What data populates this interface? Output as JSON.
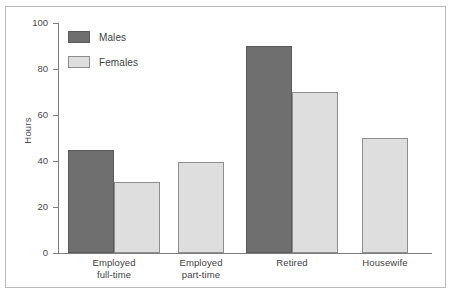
{
  "figure": {
    "caption_remnant": "",
    "border_color": "#b9b9b9"
  },
  "legend": {
    "position": "top-left-inside",
    "entries": [
      {
        "label": "Males",
        "color": "#6f6f6f"
      },
      {
        "label": "Females",
        "color": "#dedede"
      }
    ]
  },
  "axis": {
    "y_title": "Hours",
    "y_ticks": [
      "100",
      "80",
      "60",
      "40",
      "20",
      "0"
    ]
  },
  "chart_data": {
    "type": "bar",
    "title": "",
    "xlabel": "",
    "ylabel": "Hours",
    "ylim": [
      0,
      100
    ],
    "yticks": [
      0,
      20,
      40,
      60,
      80,
      100
    ],
    "grid": false,
    "legend_position": "upper left",
    "categories": [
      "Employed full-time",
      "Employed part-time",
      "Retired",
      "Housewife"
    ],
    "category_lines": [
      [
        "Employed",
        "full-time"
      ],
      [
        "Employed",
        "part-time"
      ],
      [
        "Retired"
      ],
      [
        "Housewife"
      ]
    ],
    "series": [
      {
        "name": "Males",
        "color": "#6f6f6f",
        "values": [
          45,
          null,
          90,
          null
        ]
      },
      {
        "name": "Females",
        "color": "#dedede",
        "values": [
          31,
          39.5,
          70,
          50
        ]
      }
    ]
  },
  "bars": [
    {
      "name": "bar-employed-full-time-males",
      "series": "Males",
      "category": "Employed full-time",
      "value": 45,
      "left": 62,
      "width": 46
    },
    {
      "name": "bar-employed-full-time-females",
      "series": "Females",
      "category": "Employed full-time",
      "value": 31,
      "left": 108,
      "width": 46
    },
    {
      "name": "bar-employed-part-time-females",
      "series": "Females",
      "category": "Employed part-time",
      "value": 39.5,
      "left": 172,
      "width": 46
    },
    {
      "name": "bar-retired-males",
      "series": "Males",
      "category": "Retired",
      "value": 90,
      "left": 240,
      "width": 46
    },
    {
      "name": "bar-retired-females",
      "series": "Females",
      "category": "Retired",
      "value": 70,
      "left": 286,
      "width": 46
    },
    {
      "name": "bar-housewife-females",
      "series": "Females",
      "category": "Housewife",
      "value": 50,
      "left": 356,
      "width": 46
    }
  ]
}
